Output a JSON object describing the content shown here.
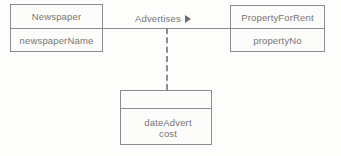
{
  "diagram": {
    "type": "entity-relationship-diagram",
    "background_color": "#fdfdfc",
    "stroke_color": "#8c8c8c",
    "text_color": "#757575"
  },
  "entities": {
    "newspaper": {
      "name": "Newspaper",
      "attributes": [
        "newspaperName"
      ]
    },
    "property": {
      "name": "PropertyForRent",
      "attributes": [
        "propertyNo"
      ]
    },
    "advert": {
      "name": "",
      "attributes": [
        "dateAdvert",
        "cost"
      ]
    }
  },
  "relationship": {
    "label": "Advertises",
    "direction_marker": "right-triangle-arrow",
    "connector_style": "solid",
    "association_style": "dashed"
  }
}
